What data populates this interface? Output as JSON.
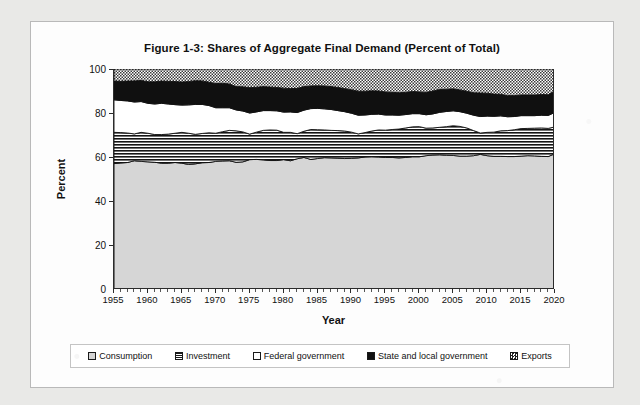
{
  "figure": {
    "title": "Figure 1-3: Shares of Aggregate Final Demand (Percent of Total)"
  },
  "axes": {
    "ylabel": "Percent",
    "xlabel": "Year",
    "yticks": [
      "0",
      "20",
      "40",
      "60",
      "80",
      "100"
    ],
    "xticks": [
      "1955",
      "1960",
      "1965",
      "1970",
      "1975",
      "1980",
      "1985",
      "1990",
      "1995",
      "2000",
      "2005",
      "2010",
      "2015",
      "2020"
    ]
  },
  "legend": {
    "items": [
      {
        "label": "Consumption",
        "swatch": "consumption-swatch"
      },
      {
        "label": "Investment",
        "swatch": "investment-swatch"
      },
      {
        "label": "Federal government",
        "swatch": "federal-government-swatch"
      },
      {
        "label": "State and local government",
        "swatch": "state-and-local-government-swatch"
      },
      {
        "label": "Exports",
        "swatch": "exports-swatch"
      }
    ]
  },
  "chart_data": {
    "type": "area",
    "stacked": true,
    "normalized": true,
    "title": "Figure 1-3: Shares of Aggregate Final Demand (Percent of Total)",
    "xlabel": "Year",
    "ylabel": "Percent",
    "xlim": [
      1955,
      2020
    ],
    "ylim": [
      0,
      100
    ],
    "ytick_step": 20,
    "xtick_step": 5,
    "grid": false,
    "legend_position": "bottom",
    "x": [
      1955,
      1956,
      1957,
      1958,
      1959,
      1960,
      1961,
      1962,
      1963,
      1964,
      1965,
      1966,
      1967,
      1968,
      1969,
      1970,
      1971,
      1972,
      1973,
      1974,
      1975,
      1976,
      1977,
      1978,
      1979,
      1980,
      1981,
      1982,
      1983,
      1984,
      1985,
      1986,
      1987,
      1988,
      1989,
      1990,
      1991,
      1992,
      1993,
      1994,
      1995,
      1996,
      1997,
      1998,
      1999,
      2000,
      2001,
      2002,
      2003,
      2004,
      2005,
      2006,
      2007,
      2008,
      2009,
      2010,
      2011,
      2012,
      2013,
      2014,
      2015,
      2016,
      2017,
      2018,
      2019,
      2020
    ],
    "series": [
      {
        "name": "Consumption",
        "fill": "light-gray",
        "values": [
          57.0,
          57.3,
          57.5,
          58.3,
          58.0,
          57.8,
          57.6,
          57.2,
          57.2,
          57.5,
          57.2,
          56.6,
          56.9,
          57.4,
          57.5,
          58.0,
          58.2,
          58.3,
          57.6,
          57.8,
          58.8,
          58.9,
          58.7,
          58.4,
          58.4,
          58.8,
          58.3,
          59.2,
          59.8,
          58.9,
          59.3,
          59.7,
          59.6,
          59.5,
          59.3,
          59.4,
          59.6,
          60.0,
          60.1,
          60.0,
          59.8,
          59.8,
          59.6,
          59.8,
          60.1,
          60.1,
          60.6,
          60.9,
          61.0,
          60.8,
          60.7,
          60.4,
          60.4,
          60.6,
          61.2,
          60.6,
          60.3,
          60.3,
          60.2,
          60.2,
          60.4,
          60.6,
          60.5,
          60.3,
          60.2,
          61.5
        ]
      },
      {
        "name": "Investment",
        "fill": "horizontal-stripes",
        "values": [
          14.2,
          13.8,
          13.4,
          12.2,
          13.2,
          13.0,
          12.6,
          13.0,
          13.2,
          13.3,
          14.0,
          14.2,
          13.4,
          13.3,
          13.5,
          12.8,
          13.3,
          13.8,
          14.3,
          13.6,
          11.6,
          12.4,
          13.4,
          13.9,
          13.8,
          12.4,
          12.9,
          11.4,
          11.9,
          13.6,
          13.1,
          12.6,
          12.5,
          12.5,
          12.5,
          11.9,
          10.9,
          11.1,
          11.7,
          12.3,
          12.4,
          12.7,
          13.1,
          13.4,
          13.6,
          13.7,
          12.5,
          12.3,
          12.5,
          13.0,
          13.5,
          13.5,
          12.8,
          11.4,
          9.7,
          10.6,
          11.0,
          11.6,
          11.8,
          12.2,
          12.5,
          12.4,
          12.6,
          12.9,
          12.8,
          12.2
        ]
      },
      {
        "name": "Federal government",
        "fill": "white",
        "values": [
          14.8,
          14.6,
          14.6,
          14.5,
          14.0,
          13.6,
          13.9,
          14.2,
          13.7,
          13.0,
          12.4,
          12.9,
          13.6,
          13.2,
          12.4,
          11.6,
          10.9,
          10.3,
          9.5,
          9.5,
          9.6,
          9.2,
          9.0,
          8.8,
          8.8,
          9.2,
          9.3,
          9.6,
          9.6,
          9.5,
          9.7,
          9.6,
          9.5,
          9.1,
          8.8,
          8.6,
          8.5,
          8.0,
          7.6,
          7.2,
          6.9,
          6.6,
          6.3,
          6.1,
          6.0,
          5.9,
          6.1,
          6.4,
          6.8,
          6.9,
          6.8,
          6.7,
          6.7,
          7.0,
          7.5,
          7.4,
          7.2,
          6.8,
          6.3,
          6.0,
          5.9,
          5.8,
          5.7,
          5.8,
          5.9,
          6.6
        ]
      },
      {
        "name": "State and local government",
        "fill": "solid-black",
        "values": [
          8.5,
          8.7,
          9.0,
          9.6,
          9.6,
          9.8,
          10.1,
          10.1,
          10.3,
          10.5,
          10.5,
          10.6,
          10.8,
          10.7,
          10.6,
          11.0,
          11.1,
          10.8,
          10.6,
          11.0,
          11.5,
          11.2,
          10.9,
          10.7,
          10.6,
          10.9,
          10.6,
          11.0,
          10.7,
          10.3,
          10.3,
          10.4,
          10.4,
          10.5,
          10.5,
          10.7,
          10.9,
          10.8,
          10.7,
          10.5,
          10.5,
          10.3,
          10.2,
          10.1,
          10.1,
          9.9,
          10.2,
          10.4,
          10.4,
          10.1,
          10.0,
          9.9,
          10.0,
          10.2,
          10.7,
          10.4,
          10.1,
          9.8,
          9.6,
          9.5,
          9.4,
          9.4,
          9.4,
          9.4,
          9.4,
          9.7
        ]
      },
      {
        "name": "Exports",
        "fill": "checkerboard",
        "values": [
          5.5,
          5.6,
          5.5,
          5.4,
          5.2,
          5.8,
          5.8,
          5.5,
          5.6,
          5.7,
          5.9,
          5.7,
          5.3,
          5.4,
          6.0,
          6.6,
          6.5,
          6.8,
          8.0,
          8.1,
          8.5,
          8.3,
          8.0,
          8.2,
          8.4,
          8.7,
          8.9,
          8.8,
          8.0,
          7.7,
          7.6,
          7.7,
          8.0,
          8.4,
          8.9,
          9.4,
          10.1,
          10.1,
          9.9,
          10.0,
          10.4,
          10.6,
          10.8,
          10.6,
          10.2,
          10.4,
          10.6,
          10.0,
          9.3,
          9.2,
          9.0,
          9.5,
          10.1,
          10.8,
          10.9,
          11.0,
          11.4,
          11.5,
          12.1,
          12.1,
          11.8,
          11.8,
          11.8,
          11.6,
          11.7,
          10.0
        ]
      }
    ]
  }
}
